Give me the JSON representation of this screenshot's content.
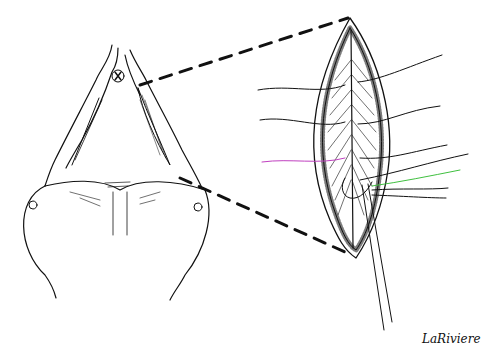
{
  "illustration": {
    "subject": "surgical line drawing with magnified inset of suture repair",
    "signature": "LaRiviere",
    "colors": {
      "ink": "#111111",
      "background": "#ffffff",
      "suture_accent": "#c040c0",
      "suture_accent2": "#40c040"
    }
  }
}
